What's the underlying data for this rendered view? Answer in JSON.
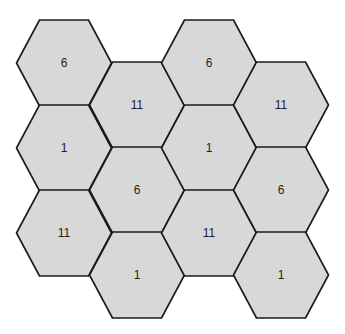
{
  "diagram": {
    "type": "hexagonal-cell-reuse-pattern",
    "colors": {
      "fill": "#d8d8d8",
      "stroke": "#1a1a1a",
      "text": "#1e1e1e",
      "background": "#ffffff"
    },
    "cells": [
      {
        "col": 0,
        "row": 0,
        "cx": 64,
        "cy": 63,
        "label": "6"
      },
      {
        "col": 0,
        "row": 1,
        "cx": 64,
        "cy": 148,
        "label": "1"
      },
      {
        "col": 0,
        "row": 2,
        "cx": 64,
        "cy": 233,
        "label": "11"
      },
      {
        "col": 1,
        "row": 0,
        "cx": 137,
        "cy": 105,
        "label": "11"
      },
      {
        "col": 1,
        "row": 1,
        "cx": 137,
        "cy": 190,
        "label": "6"
      },
      {
        "col": 1,
        "row": 2,
        "cx": 137,
        "cy": 275,
        "label": "1"
      },
      {
        "col": 2,
        "row": 0,
        "cx": 209,
        "cy": 63,
        "label": "6"
      },
      {
        "col": 2,
        "row": 1,
        "cx": 209,
        "cy": 148,
        "label": "1"
      },
      {
        "col": 2,
        "row": 2,
        "cx": 209,
        "cy": 233,
        "label": "11"
      },
      {
        "col": 3,
        "row": 0,
        "cx": 281,
        "cy": 105,
        "label": "11"
      },
      {
        "col": 3,
        "row": 1,
        "cx": 281,
        "cy": 190,
        "label": "6"
      },
      {
        "col": 3,
        "row": 2,
        "cx": 281,
        "cy": 275,
        "label": "1"
      }
    ]
  }
}
